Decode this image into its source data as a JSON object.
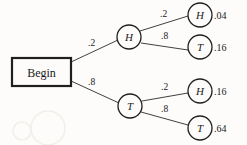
{
  "figure": {
    "type": "probability-tree-diagram",
    "root": {
      "label": "Begin"
    },
    "level1": [
      {
        "id": "h1",
        "letter": "H",
        "weight": ".2"
      },
      {
        "id": "t1",
        "letter": "T",
        "weight": ".8"
      }
    ],
    "level2": [
      {
        "id": "h1h2",
        "letter": "H",
        "weight": ".2",
        "outcome": ".04"
      },
      {
        "id": "h1t2",
        "letter": "T",
        "weight": ".8",
        "outcome": ".16"
      },
      {
        "id": "t1h2",
        "letter": "H",
        "weight": ".2",
        "outcome": ".16"
      },
      {
        "id": "t1t2",
        "letter": "T",
        "weight": ".8",
        "outcome": ".64"
      }
    ],
    "colors": {
      "ink": "#1f1f1f",
      "line": "#2b2b2b",
      "paper": "#fdfcfa"
    }
  }
}
